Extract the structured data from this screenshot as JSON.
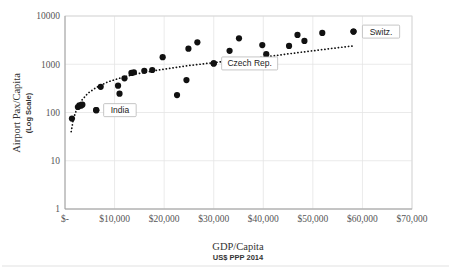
{
  "chart_data": {
    "type": "scatter",
    "title": "",
    "xlabel": "GDP/Capita",
    "xlabel_sub": "US$ PPP 2014",
    "ylabel": "Airport Pax/Capita",
    "ylabel_sub": "(Log Scale)",
    "xlim": [
      0,
      70000
    ],
    "ylim": [
      1,
      10000
    ],
    "yscale": "log",
    "grid": true,
    "legend": "none",
    "x_ticks": [
      0,
      10000,
      20000,
      30000,
      40000,
      50000,
      60000,
      70000
    ],
    "x_tick_labels": [
      "$-",
      "$10,000",
      "$20,000",
      "$30,000",
      "$40,000",
      "$50,000",
      "$60,000",
      "$70,000"
    ],
    "y_ticks": [
      1,
      10,
      100,
      1000,
      10000
    ],
    "y_tick_labels": [
      "1",
      "10",
      "100",
      "1000",
      "10000"
    ],
    "points": [
      {
        "x": 1400,
        "y": 75
      },
      {
        "x": 2600,
        "y": 130
      },
      {
        "x": 2900,
        "y": 140
      },
      {
        "x": 3200,
        "y": 138
      },
      {
        "x": 3500,
        "y": 145
      },
      {
        "x": 6300,
        "y": 112
      },
      {
        "x": 7200,
        "y": 340
      },
      {
        "x": 10700,
        "y": 360
      },
      {
        "x": 11000,
        "y": 245
      },
      {
        "x": 12000,
        "y": 510
      },
      {
        "x": 13400,
        "y": 660
      },
      {
        "x": 13900,
        "y": 680
      },
      {
        "x": 16000,
        "y": 730
      },
      {
        "x": 17600,
        "y": 760
      },
      {
        "x": 19700,
        "y": 1400
      },
      {
        "x": 22600,
        "y": 230
      },
      {
        "x": 24500,
        "y": 470
      },
      {
        "x": 24900,
        "y": 2100
      },
      {
        "x": 26700,
        "y": 2850
      },
      {
        "x": 30000,
        "y": 1040
      },
      {
        "x": 33200,
        "y": 1900
      },
      {
        "x": 35100,
        "y": 3450
      },
      {
        "x": 39800,
        "y": 2500
      },
      {
        "x": 40600,
        "y": 1620
      },
      {
        "x": 45200,
        "y": 2400
      },
      {
        "x": 46900,
        "y": 4050
      },
      {
        "x": 48300,
        "y": 3050
      },
      {
        "x": 51900,
        "y": 4450
      },
      {
        "x": 58200,
        "y": 4750
      }
    ],
    "trendline": {
      "style": "dotted",
      "description": "logarithmic fit",
      "points": [
        {
          "x": 1250,
          "y": 40
        },
        {
          "x": 1700,
          "y": 75
        },
        {
          "x": 2400,
          "y": 120
        },
        {
          "x": 3300,
          "y": 175
        },
        {
          "x": 4600,
          "y": 250
        },
        {
          "x": 6300,
          "y": 330
        },
        {
          "x": 8600,
          "y": 430
        },
        {
          "x": 11200,
          "y": 520
        },
        {
          "x": 14000,
          "y": 620
        },
        {
          "x": 17500,
          "y": 720
        },
        {
          "x": 21000,
          "y": 820
        },
        {
          "x": 25000,
          "y": 940
        },
        {
          "x": 30000,
          "y": 1080
        },
        {
          "x": 35000,
          "y": 1230
        },
        {
          "x": 40000,
          "y": 1400
        },
        {
          "x": 45000,
          "y": 1640
        },
        {
          "x": 50000,
          "y": 1900
        },
        {
          "x": 55000,
          "y": 2200
        },
        {
          "x": 58500,
          "y": 2420
        }
      ]
    },
    "annotations": [
      {
        "label": "India",
        "point": {
          "x": 6300,
          "y": 112
        },
        "box_x": 7800,
        "box_y": 112
      },
      {
        "label": "Czech Rep.",
        "point": {
          "x": 30000,
          "y": 1040
        },
        "box_x": 31600,
        "box_y": 1040
      },
      {
        "label": "Switz.",
        "point": {
          "x": 58200,
          "y": 4750
        },
        "box_x": 60000,
        "box_y": 4750
      }
    ]
  }
}
